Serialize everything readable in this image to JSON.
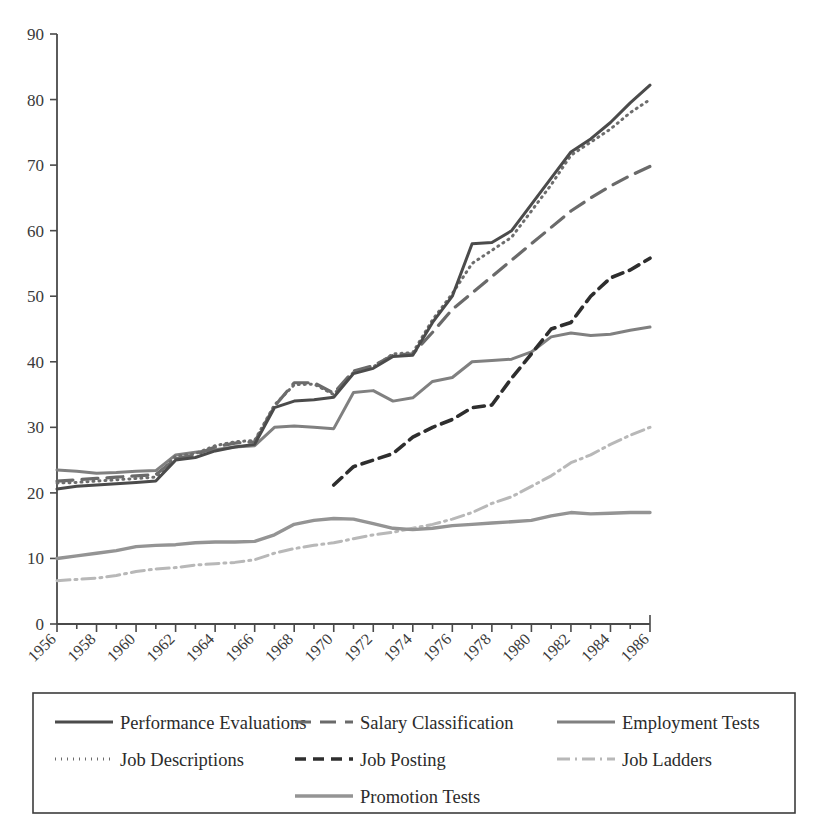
{
  "chart_data": {
    "type": "line",
    "title": "",
    "subtitle": "",
    "xlabel": "",
    "ylabel": "",
    "xlim": [
      1956,
      1986
    ],
    "ylim": [
      0,
      90
    ],
    "ytick_step": 10,
    "xtick_step": 2,
    "grid": false,
    "legend_position": "bottom",
    "yticks": [
      "0",
      "10",
      "20",
      "30",
      "40",
      "50",
      "60",
      "70",
      "80",
      "90"
    ],
    "xticks": [
      "1956",
      "1958",
      "1960",
      "1962",
      "1964",
      "1966",
      "1968",
      "1970",
      "1972",
      "1974",
      "1976",
      "1978",
      "1980",
      "1982",
      "1984",
      "1986"
    ],
    "x": [
      1956,
      1957,
      1958,
      1959,
      1960,
      1961,
      1962,
      1963,
      1964,
      1965,
      1966,
      1967,
      1968,
      1969,
      1970,
      1971,
      1972,
      1973,
      1974,
      1975,
      1976,
      1977,
      1978,
      1979,
      1980,
      1981,
      1982,
      1983,
      1984,
      1985,
      1986
    ],
    "series": [
      {
        "name": "Performance Evaluations",
        "style": "solid",
        "color": "#4b4b4b",
        "width": 3.0,
        "dash": "",
        "values": [
          20.6,
          21.0,
          21.2,
          21.4,
          21.6,
          21.8,
          25.0,
          25.4,
          26.4,
          27.0,
          27.4,
          33.0,
          34.0,
          34.2,
          34.6,
          38.2,
          39.0,
          40.8,
          41.0,
          46.0,
          50.0,
          58.0,
          58.2,
          60.0,
          64.0,
          68.0,
          72.0,
          74.0,
          76.5,
          79.5,
          82.2
        ]
      },
      {
        "name": "Job Descriptions",
        "style": "dotted",
        "color": "#6d6d6d",
        "width": 3.0,
        "dash": "1 5",
        "values": [
          21.5,
          21.6,
          21.8,
          22.0,
          22.2,
          22.4,
          25.6,
          26.0,
          27.2,
          27.8,
          28.0,
          33.4,
          36.5,
          36.6,
          35.0,
          38.4,
          39.2,
          41.2,
          41.4,
          46.4,
          50.4,
          55.0,
          57.0,
          59.0,
          63.0,
          67.0,
          71.5,
          73.5,
          75.5,
          78.0,
          80.0
        ]
      },
      {
        "name": "Salary Classification",
        "style": "long-dash",
        "color": "#6a6a6a",
        "width": 3.2,
        "dash": "16 9",
        "values": [
          21.8,
          22.0,
          22.2,
          22.4,
          22.6,
          22.8,
          25.2,
          25.8,
          27.0,
          27.6,
          27.8,
          33.2,
          36.8,
          36.8,
          35.2,
          38.6,
          39.4,
          41.0,
          41.2,
          44.5,
          48.0,
          50.5,
          53.0,
          55.5,
          58.0,
          60.5,
          63.0,
          65.0,
          66.8,
          68.4,
          69.8
        ]
      },
      {
        "name": "Employment Tests",
        "style": "solid",
        "color": "#808080",
        "width": 3.0,
        "dash": "",
        "values": [
          23.5,
          23.3,
          23.0,
          23.1,
          23.3,
          23.4,
          25.8,
          26.2,
          26.6,
          27.0,
          27.2,
          30.0,
          30.2,
          30.0,
          29.8,
          35.3,
          35.6,
          34.0,
          34.5,
          37.0,
          37.6,
          40.0,
          40.2,
          40.4,
          41.5,
          43.8,
          44.4,
          44.0,
          44.2,
          44.8,
          45.3
        ]
      },
      {
        "name": "Job Posting",
        "style": "dash",
        "color": "#2e2e2e",
        "width": 3.6,
        "dash": "11 7",
        "values": [
          null,
          null,
          null,
          null,
          null,
          null,
          null,
          null,
          null,
          null,
          null,
          null,
          null,
          null,
          21.2,
          24.0,
          25.0,
          26.0,
          28.5,
          30.0,
          31.2,
          33.0,
          33.4,
          37.5,
          41.2,
          45.0,
          46.0,
          50.0,
          52.8,
          54.0,
          55.8
        ]
      },
      {
        "name": "Promotion Tests",
        "style": "solid",
        "color": "#949494",
        "width": 3.4,
        "dash": "",
        "values": [
          10.0,
          10.4,
          10.8,
          11.2,
          11.8,
          12.0,
          12.1,
          12.4,
          12.5,
          12.5,
          12.6,
          13.6,
          15.2,
          15.8,
          16.1,
          16.0,
          15.3,
          14.6,
          14.4,
          14.6,
          15.0,
          15.2,
          15.4,
          15.6,
          15.8,
          16.5,
          17.0,
          16.8,
          16.9,
          17.0,
          17.0
        ]
      },
      {
        "name": "Job Ladders",
        "style": "dash-dot",
        "color": "#b8b8b8",
        "width": 3.0,
        "dash": "13 5 2 5",
        "values": [
          6.6,
          6.8,
          7.0,
          7.4,
          8.0,
          8.4,
          8.6,
          9.0,
          9.2,
          9.4,
          9.8,
          10.8,
          11.5,
          12.0,
          12.4,
          13.0,
          13.6,
          14.0,
          14.6,
          15.2,
          16.0,
          17.0,
          18.4,
          19.4,
          21.0,
          22.6,
          24.6,
          25.8,
          27.4,
          28.8,
          30.0
        ]
      }
    ]
  },
  "legend": {
    "items": [
      {
        "label": "Performance Evaluations",
        "series": 0,
        "column": 0,
        "row": 0
      },
      {
        "label": "Salary Classification",
        "series": 2,
        "column": 1,
        "row": 0
      },
      {
        "label": "Employment Tests",
        "series": 3,
        "column": 2,
        "row": 0
      },
      {
        "label": "Job Descriptions",
        "series": 1,
        "column": 0,
        "row": 1
      },
      {
        "label": "Job Posting",
        "series": 4,
        "column": 1,
        "row": 1
      },
      {
        "label": "Job Ladders",
        "series": 6,
        "column": 2,
        "row": 1
      },
      {
        "label": "Promotion Tests",
        "series": 5,
        "column": 1,
        "row": 2
      }
    ]
  },
  "colors": {
    "axis": "#4a4a4a",
    "text": "#2b2b2b",
    "background": "#ffffff",
    "legend_border": "#3c3c3c"
  }
}
